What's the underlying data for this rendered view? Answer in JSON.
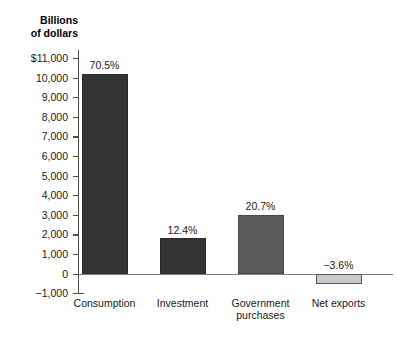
{
  "chart_data": {
    "type": "bar",
    "title": "",
    "subtitle": "",
    "xlabel": "",
    "ylabel": "Billions\nof dollars",
    "ylim": [
      -1000,
      11000
    ],
    "grid": false,
    "legend": "none",
    "categories": [
      "Consumption",
      "Investment",
      "Government\npurchases",
      "Net exports"
    ],
    "values": [
      10200,
      1800,
      3000,
      -520
    ],
    "data_labels": [
      "70.5%",
      "12.4%",
      "20.7%",
      "−3.6%"
    ],
    "y_ticks": [
      11000,
      10000,
      9000,
      8000,
      7000,
      6000,
      5000,
      4000,
      3000,
      2000,
      1000,
      0,
      -1000
    ],
    "y_tick_labels": [
      "$11,000",
      "10,000",
      "9,000",
      "8,000",
      "7,000",
      "6,000",
      "5,000",
      "4,000",
      "3,000",
      "2,000",
      "1,000",
      "0",
      "−1,000"
    ],
    "series": [
      {
        "name": "GDP components",
        "points": [
          {
            "category": "Consumption",
            "value": 10200,
            "share": "70.5%",
            "fill": "#333333"
          },
          {
            "category": "Investment",
            "value": 1800,
            "share": "12.4%",
            "fill": "#333333"
          },
          {
            "category": "Government purchases",
            "value": 3000,
            "share": "20.7%",
            "fill": "#5a5a5a"
          },
          {
            "category": "Net exports",
            "value": -520,
            "share": "−3.6%",
            "fill": "#c9c9c9"
          }
        ]
      }
    ],
    "colors": {
      "background": "#ffffff",
      "axis": "#4d4d4d",
      "zero_line": "#808080",
      "text": "#1a1a1a",
      "bar_dark": "#333333",
      "bar_mid": "#5a5a5a",
      "bar_light": "#c9c9c9"
    }
  }
}
